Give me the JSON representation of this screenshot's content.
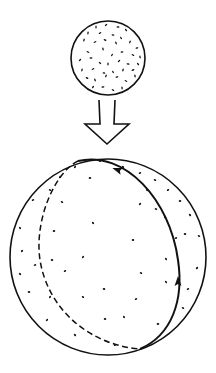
{
  "diagram": {
    "background": "#ffffff",
    "stroke_color": "#111111",
    "small_sphere": {
      "cx": 108,
      "cy": 58,
      "r": 37,
      "dots": [
        [
          96,
          27
        ],
        [
          106,
          25
        ],
        [
          118,
          27
        ],
        [
          126,
          30
        ],
        [
          88,
          33
        ],
        [
          100,
          33
        ],
        [
          113,
          35
        ],
        [
          121,
          38
        ],
        [
          84,
          40
        ],
        [
          95,
          42
        ],
        [
          105,
          40
        ],
        [
          116,
          43
        ],
        [
          130,
          42
        ],
        [
          137,
          48
        ],
        [
          88,
          52
        ],
        [
          103,
          49
        ],
        [
          112,
          55
        ],
        [
          122,
          52
        ],
        [
          133,
          55
        ],
        [
          140,
          57
        ],
        [
          80,
          60
        ],
        [
          91,
          58
        ],
        [
          100,
          63
        ],
        [
          108,
          64
        ],
        [
          119,
          61
        ],
        [
          128,
          64
        ],
        [
          138,
          64
        ],
        [
          82,
          70
        ],
        [
          93,
          69
        ],
        [
          104,
          73
        ],
        [
          113,
          72
        ],
        [
          123,
          70
        ],
        [
          133,
          70
        ],
        [
          87,
          78
        ],
        [
          95,
          80
        ],
        [
          106,
          76
        ],
        [
          117,
          77
        ],
        [
          126,
          81
        ],
        [
          135,
          76
        ],
        [
          93,
          87
        ],
        [
          103,
          87
        ],
        [
          113,
          90
        ],
        [
          122,
          88
        ]
      ]
    },
    "arrow": {
      "shaft_left": 99,
      "shaft_right": 115,
      "shaft_top": 100,
      "shaft_bottom": 124,
      "head_left": 85,
      "head_right": 129,
      "tip_x": 107,
      "tip_y": 144
    },
    "large_sphere": {
      "cx": 108,
      "cy": 257,
      "r": 98,
      "dots": [
        [
          75,
          167
        ],
        [
          100,
          161
        ],
        [
          123,
          167
        ],
        [
          140,
          173
        ],
        [
          155,
          180
        ],
        [
          168,
          190
        ],
        [
          50,
          190
        ],
        [
          60,
          177
        ],
        [
          90,
          178
        ],
        [
          147,
          190
        ],
        [
          180,
          201
        ],
        [
          190,
          215
        ],
        [
          33,
          200
        ],
        [
          62,
          202
        ],
        [
          140,
          204
        ],
        [
          156,
          209
        ],
        [
          165,
          217
        ],
        [
          185,
          234
        ],
        [
          20,
          228
        ],
        [
          54,
          231
        ],
        [
          93,
          223
        ],
        [
          176,
          238
        ],
        [
          199,
          236
        ],
        [
          22,
          251
        ],
        [
          52,
          260
        ],
        [
          83,
          257
        ],
        [
          133,
          240
        ],
        [
          166,
          259
        ],
        [
          35,
          265
        ],
        [
          20,
          274
        ],
        [
          65,
          271
        ],
        [
          141,
          273
        ],
        [
          197,
          268
        ],
        [
          29,
          292
        ],
        [
          50,
          297
        ],
        [
          104,
          289
        ],
        [
          166,
          282
        ],
        [
          188,
          289
        ],
        [
          83,
          297
        ],
        [
          136,
          299
        ],
        [
          183,
          308
        ],
        [
          47,
          320
        ],
        [
          105,
          319
        ],
        [
          124,
          317
        ],
        [
          158,
          324
        ],
        [
          75,
          335
        ],
        [
          115,
          345
        ]
      ]
    },
    "great_circle": {
      "front_path": "M78,161 C125,150 170,200 178,260 C184,300 172,335 140,349",
      "back_path": "M78,161 C55,172 34,220 40,260 C48,310 90,345 140,349",
      "front_arrow_top": {
        "x": 118,
        "y": 170,
        "angle": 200
      },
      "front_arrow_side": {
        "x": 178,
        "y": 282,
        "angle": 270
      }
    }
  }
}
